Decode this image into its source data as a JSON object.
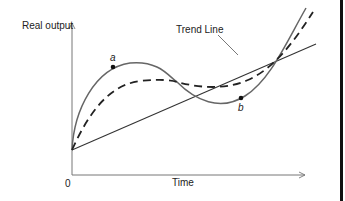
{
  "diagram": {
    "y_axis_label": "Real output",
    "x_axis_label": "Time",
    "origin_label": "0",
    "trend_label": "Trend Line",
    "point_a_label": "a",
    "point_b_label": "b",
    "colors": {
      "axis": "#777777",
      "solid_curve": "#666666",
      "dashed_curve": "#222222",
      "trend": "#333333",
      "border": "#111111"
    }
  }
}
